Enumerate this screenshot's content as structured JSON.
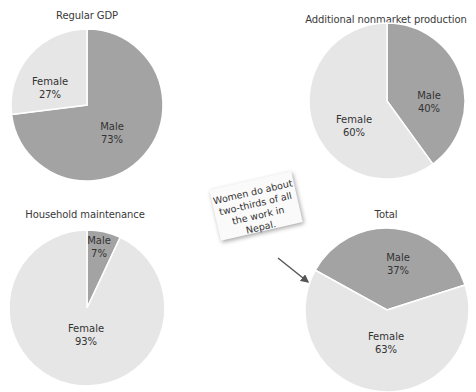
{
  "colors": {
    "male": "#a3a3a3",
    "female": "#e6e6e6",
    "divider": "#ffffff"
  },
  "chart_data": [
    {
      "type": "pie",
      "title": "Regular GDP",
      "slices": [
        {
          "label": "Male",
          "value": 73,
          "display": "73%"
        },
        {
          "label": "Female",
          "value": 27,
          "display": "27%"
        }
      ]
    },
    {
      "type": "pie",
      "title": "Additional nonmarket production",
      "slices": [
        {
          "label": "Male",
          "value": 40,
          "display": "40%"
        },
        {
          "label": "Female",
          "value": 60,
          "display": "60%"
        }
      ]
    },
    {
      "type": "pie",
      "title": "Household maintenance",
      "slices": [
        {
          "label": "Male",
          "value": 7,
          "display": "7%"
        },
        {
          "label": "Female",
          "value": 93,
          "display": "93%"
        }
      ]
    },
    {
      "type": "pie",
      "title": "Total",
      "slices": [
        {
          "label": "Male",
          "value": 37,
          "display": "37%"
        },
        {
          "label": "Female",
          "value": 63,
          "display": "63%"
        }
      ]
    }
  ],
  "annotation": {
    "lines": [
      "Women do about",
      "two-thirds of all",
      "the work in Nepal."
    ]
  }
}
